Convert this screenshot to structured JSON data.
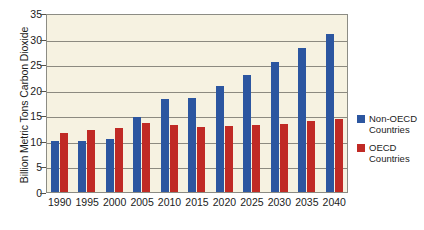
{
  "chart_data": {
    "type": "bar",
    "title": "",
    "xlabel": "",
    "ylabel": "Billion Metric Tons Carbon Dioxide",
    "ylim": [
      0,
      35
    ],
    "ytick_labels": [
      "0",
      "5",
      "10",
      "15",
      "20",
      "25",
      "30",
      "35"
    ],
    "ytick_values": [
      0,
      5,
      10,
      15,
      20,
      25,
      30,
      35
    ],
    "grid": true,
    "legend_position": "right",
    "categories": [
      "1990",
      "1995",
      "2000",
      "2005",
      "2010",
      "2015",
      "2020",
      "2025",
      "2030",
      "2035",
      "2040"
    ],
    "series": [
      {
        "name": "Non-OECD Countries",
        "color": "#2c56a0",
        "values": [
          10.0,
          10.0,
          10.4,
          14.6,
          18.1,
          18.3,
          20.7,
          22.8,
          25.5,
          28.2,
          30.9
        ]
      },
      {
        "name": "OECD Countries",
        "color": "#c02a25",
        "values": [
          11.5,
          12.1,
          12.6,
          13.5,
          13.2,
          12.8,
          12.9,
          13.1,
          13.3,
          13.8,
          14.2
        ]
      }
    ]
  },
  "legend": {
    "entries": [
      {
        "line1": "Non-OECD",
        "line2": "Countries"
      },
      {
        "line1": "OECD",
        "line2": "Countries"
      }
    ]
  },
  "colors": {
    "plot_background": "#f6f2e1",
    "frame": "#8c8c84",
    "gridline": "#8c8a80",
    "non_oecd": "#2c56a0",
    "oecd": "#c02a25",
    "page_background": "#ffffff"
  }
}
